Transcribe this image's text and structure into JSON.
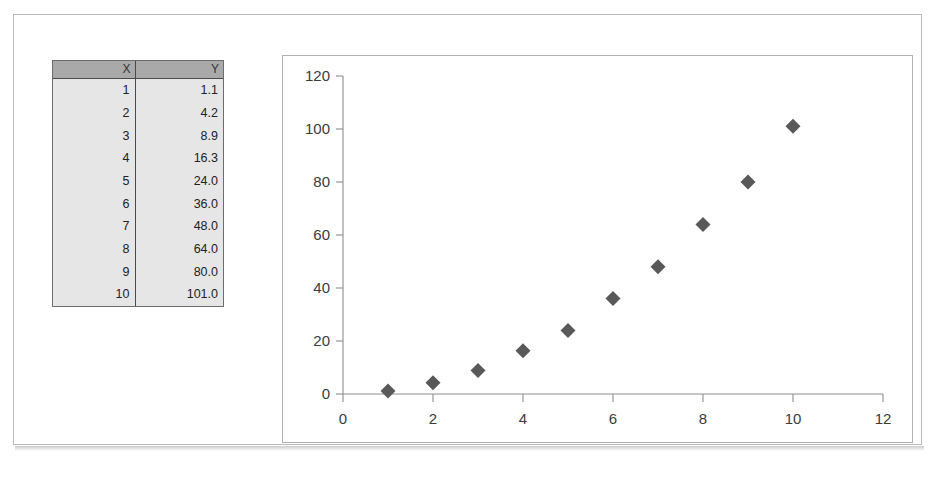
{
  "document": {
    "frame_border_color": "#b9b9b9",
    "background": "#ffffff"
  },
  "table": {
    "name": "xy-data-table",
    "header_background": "#a9a9a9",
    "body_background": "#e6e6e6",
    "columns": [
      "X",
      "Y"
    ],
    "rows": [
      {
        "x": "1",
        "y": "1.1"
      },
      {
        "x": "2",
        "y": "4.2"
      },
      {
        "x": "3",
        "y": "8.9"
      },
      {
        "x": "4",
        "y": "16.3"
      },
      {
        "x": "5",
        "y": "24.0"
      },
      {
        "x": "6",
        "y": "36.0"
      },
      {
        "x": "7",
        "y": "48.0"
      },
      {
        "x": "8",
        "y": "64.0"
      },
      {
        "x": "9",
        "y": "80.0"
      },
      {
        "x": "10",
        "y": "101.0"
      }
    ]
  },
  "chart_data": {
    "type": "scatter",
    "title": "",
    "xlabel": "",
    "ylabel": "",
    "x": [
      1,
      2,
      3,
      4,
      5,
      6,
      7,
      8,
      9,
      10
    ],
    "values": [
      1.1,
      4.2,
      8.9,
      16.3,
      24.0,
      36.0,
      48.0,
      64.0,
      80.0,
      101.0
    ],
    "series": [
      {
        "name": "Y",
        "x": [
          1,
          2,
          3,
          4,
          5,
          6,
          7,
          8,
          9,
          10
        ],
        "values": [
          1.1,
          4.2,
          8.9,
          16.3,
          24.0,
          36.0,
          48.0,
          64.0,
          80.0,
          101.0
        ]
      }
    ],
    "xlim": [
      0,
      12
    ],
    "ylim": [
      0,
      120
    ],
    "xticks": [
      0,
      2,
      4,
      6,
      8,
      10,
      12
    ],
    "yticks": [
      0,
      20,
      40,
      60,
      80,
      100,
      120
    ],
    "xtick_labels": [
      "0",
      "2",
      "4",
      "6",
      "8",
      "10",
      "12"
    ],
    "ytick_labels": [
      "0",
      "20",
      "40",
      "60",
      "80",
      "100",
      "120"
    ],
    "grid": false,
    "legend": false,
    "legend_position": "none",
    "marker_shape": "diamond",
    "marker_color": "#595959",
    "axis_color": "#8d8d8d",
    "plot_border_color": "#b0b0b0"
  }
}
